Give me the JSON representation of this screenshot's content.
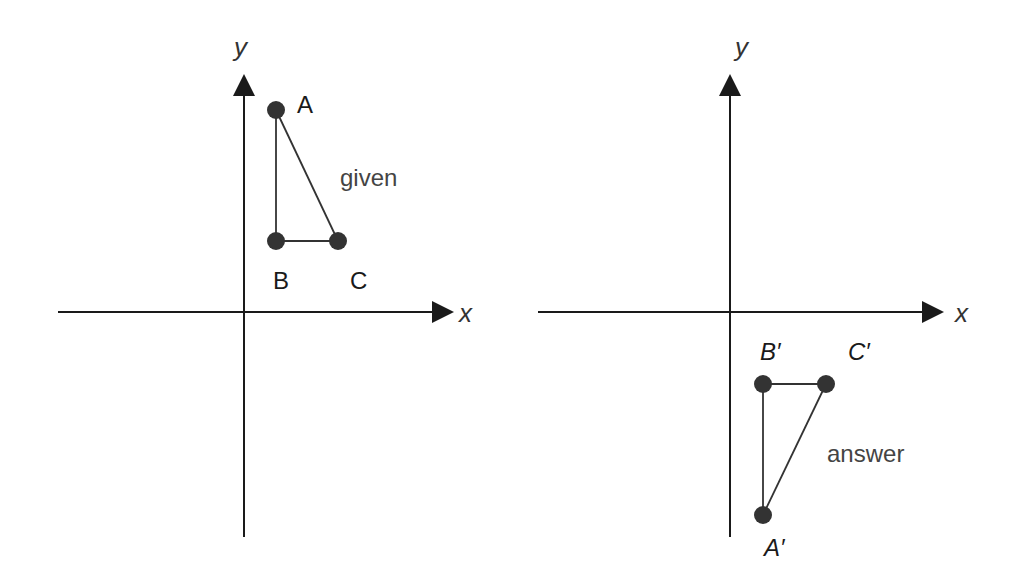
{
  "left_graph": {
    "x_axis_label": "x",
    "y_axis_label": "y",
    "caption": "given",
    "vertices": {
      "A": {
        "label": "A",
        "cx": 276,
        "cy": 110
      },
      "B": {
        "label": "B",
        "cx": 276,
        "cy": 241
      },
      "C": {
        "label": "C",
        "cx": 338,
        "cy": 241
      }
    }
  },
  "right_graph": {
    "x_axis_label": "x",
    "y_axis_label": "y",
    "caption": "answer",
    "vertices": {
      "A": {
        "label": "A′",
        "cx": 763,
        "cy": 515
      },
      "B": {
        "label": "B′",
        "cx": 763,
        "cy": 384
      },
      "C": {
        "label": "C′",
        "cx": 826,
        "cy": 384
      }
    }
  },
  "colors": {
    "axis": "#1a1a1a",
    "point": "#333333",
    "text": "#333333"
  }
}
